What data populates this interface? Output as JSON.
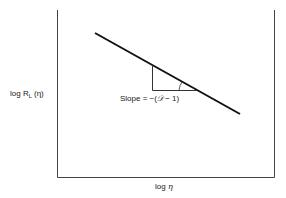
{
  "diagram": {
    "type": "log-log plot schematic",
    "y_axis_label": {
      "prefix": "log R",
      "subscript": "L",
      "suffix": " (η)"
    },
    "x_axis_label": {
      "prefix": "log ",
      "var": "η"
    },
    "slope_label": {
      "prefix": "Slope = −(",
      "var": "𝒟",
      "suffix": " − 1)"
    },
    "line": {
      "x1": 95,
      "y1": 33,
      "x2": 240,
      "y2": 114
    },
    "triangle": {
      "vx": 152,
      "top_y": 65,
      "base_y": 90,
      "right_x": 196
    },
    "colors": {
      "line": "#111111",
      "axis": "#333333",
      "triangle": "#333333"
    }
  }
}
